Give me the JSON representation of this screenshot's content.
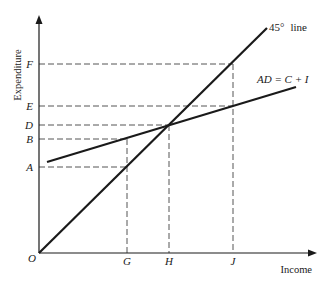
{
  "diagram": {
    "type": "keynesian-cross",
    "axes": {
      "x_label": "Income",
      "y_label": "Expenditure",
      "origin_label": "O"
    },
    "y_ticks": [
      {
        "label": "F",
        "y": 64
      },
      {
        "label": "E",
        "y": 106
      },
      {
        "label": "D",
        "y": 125
      },
      {
        "label": "B",
        "y": 139
      },
      {
        "label": "A",
        "y": 167
      }
    ],
    "x_ticks": [
      {
        "label": "G",
        "x": 127
      },
      {
        "label": "H",
        "x": 169
      },
      {
        "label": "J",
        "x": 233
      }
    ],
    "lines": {
      "line_45": {
        "label": "45°  line",
        "deg": "45°",
        "word": "line"
      },
      "ad_line": {
        "label": "AD = C + I"
      }
    },
    "colors": {
      "ink": "#1a1a1a",
      "dash": "#555555",
      "background": "#ffffff"
    }
  }
}
